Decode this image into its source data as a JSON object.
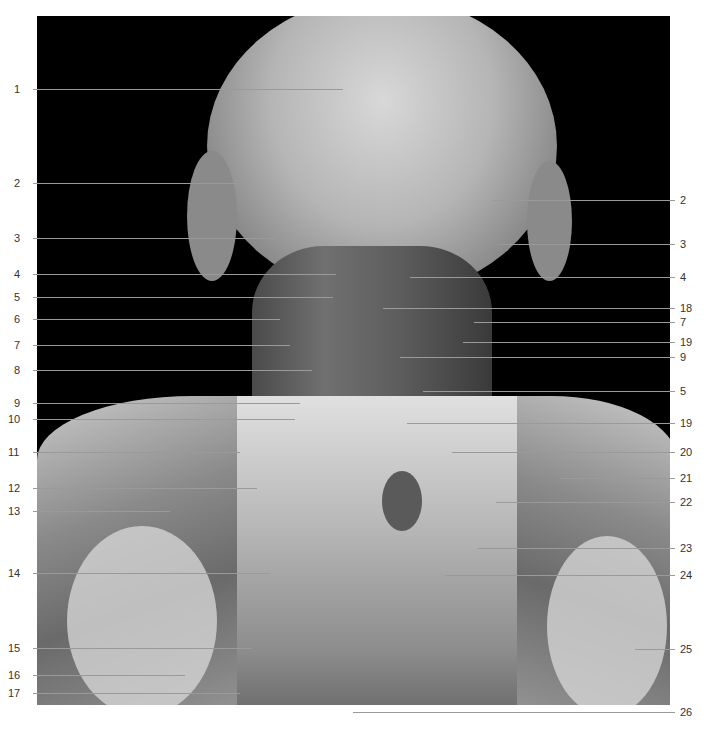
{
  "figure": {
    "type": "anatomical dissection photograph (posterior neck and shoulders)",
    "colors": {
      "background": "#ffffff",
      "photo_bg": "#000000",
      "leader": "#9a9a9a",
      "text": "#333333"
    },
    "left_labels": [
      {
        "num": "1",
        "y": 89,
        "x_end": 343
      },
      {
        "num": "2",
        "y": 183,
        "x_end": 252
      },
      {
        "num": "3",
        "y": 238,
        "x_end": 278
      },
      {
        "num": "4",
        "y": 274,
        "x_end": 336
      },
      {
        "num": "5",
        "y": 297,
        "x_end": 333
      },
      {
        "num": "6",
        "y": 319,
        "x_end": 280
      },
      {
        "num": "7",
        "y": 345,
        "x_end": 290
      },
      {
        "num": "8",
        "y": 370,
        "x_end": 312
      },
      {
        "num": "9",
        "y": 403,
        "x_end": 300
      },
      {
        "num": "10",
        "y": 419,
        "x_end": 295
      },
      {
        "num": "11",
        "y": 452,
        "x_end": 240
      },
      {
        "num": "12",
        "y": 488,
        "x_end": 257
      },
      {
        "num": "13",
        "y": 511,
        "x_end": 170
      },
      {
        "num": "14",
        "y": 573,
        "x_end": 270
      },
      {
        "num": "15",
        "y": 648,
        "x_end": 252
      },
      {
        "num": "16",
        "y": 675,
        "x_end": 185
      },
      {
        "num": "17",
        "y": 693,
        "x_end": 240
      }
    ],
    "right_labels": [
      {
        "num": "2",
        "y": 200,
        "x_start": 493
      },
      {
        "num": "3",
        "y": 244,
        "x_start": 497
      },
      {
        "num": "4",
        "y": 277,
        "x_start": 410
      },
      {
        "num": "18",
        "y": 308,
        "x_start": 383
      },
      {
        "num": "7",
        "y": 322,
        "x_start": 474
      },
      {
        "num": "19",
        "y": 342,
        "x_start": 463
      },
      {
        "num": "9",
        "y": 357,
        "x_start": 400
      },
      {
        "num": "5",
        "y": 391,
        "x_start": 423
      },
      {
        "num": "19",
        "y": 423,
        "x_start": 407
      },
      {
        "num": "20",
        "y": 452,
        "x_start": 452
      },
      {
        "num": "21",
        "y": 478,
        "x_start": 560
      },
      {
        "num": "22",
        "y": 502,
        "x_start": 496
      },
      {
        "num": "23",
        "y": 548,
        "x_start": 478
      },
      {
        "num": "24",
        "y": 575,
        "x_start": 445
      },
      {
        "num": "25",
        "y": 649,
        "x_start": 635
      },
      {
        "num": "26",
        "y": 712,
        "x_start": 353
      }
    ]
  }
}
